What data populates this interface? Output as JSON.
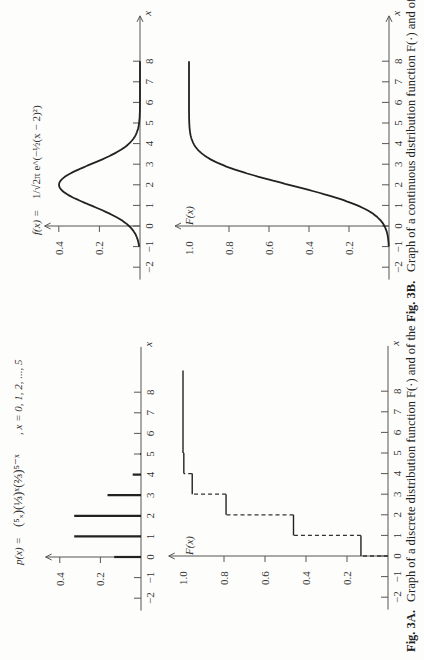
{
  "figures": {
    "fig3a": {
      "caption_label": "Fig. 3A.",
      "caption_text": "Graph of a discrete distribution function F(·) and of the",
      "pmf_formula": "p(x) = (5 choose x)(1/3)^x(2/3)^(5−x)",
      "pmf_formula_lhs": "p(x) =",
      "pmf_formula_rhs": "(⁵ₓ)(⅓)ˣ(⅔)⁵⁻ˣ",
      "pmf_domain": ", x = 0, 1, 2, ..., 5",
      "cdf_axis_label": "F(x)"
    },
    "fig3b": {
      "caption_label": "Fig. 3B.",
      "caption_text": "Graph of a continuous distribution function F(·) and of",
      "pdf_formula_lhs": "f(x) =",
      "pdf_formula_rhs": "1/√2π  e^(−½(x − 2)²)",
      "cdf_axis_label": "F(x)"
    }
  },
  "chart_data": [
    {
      "id": "fig3b-density",
      "type": "line",
      "title": "f(x) = 1/√(2π) e^(−½(x−2)²)",
      "xlabel": "x",
      "ylabel": "f(x)",
      "x_ticks": [
        -2,
        -1,
        0,
        1,
        2,
        3,
        4,
        5,
        6,
        7,
        8
      ],
      "y_ticks": [
        0.2,
        0.4
      ],
      "xlim": [
        -2.5,
        9
      ],
      "ylim": [
        0,
        0.45
      ],
      "curve": "normal_pdf",
      "mean": 2,
      "sd": 1,
      "x_range": [
        -1,
        8
      ],
      "orientation": "rotated -90deg (x-axis vertical, page landscape)"
    },
    {
      "id": "fig3b-cdf",
      "type": "line",
      "title": "Continuous distribution function",
      "xlabel": "x",
      "ylabel": "F(x)",
      "x_ticks": [
        -2,
        -1,
        0,
        1,
        2,
        3,
        4,
        5,
        6,
        7,
        8
      ],
      "y_ticks": [
        0.2,
        0.4,
        0.6,
        0.8,
        1.0
      ],
      "xlim": [
        -2.5,
        9
      ],
      "ylim": [
        0,
        1.05
      ],
      "curve": "normal_cdf",
      "mean": 2,
      "sd": 1,
      "x_range": [
        -1,
        8
      ]
    },
    {
      "id": "fig3a-pmf",
      "type": "bar",
      "title": "p(x) = C(5,x)(1/3)^x(2/3)^(5−x), x = 0,1,2,...,5",
      "xlabel": "x",
      "ylabel": "p(x)",
      "categories": [
        0,
        1,
        2,
        3,
        4,
        5
      ],
      "values": [
        0.132,
        0.329,
        0.329,
        0.165,
        0.041,
        0.004
      ],
      "x_ticks": [
        -2,
        -1,
        0,
        1,
        2,
        3,
        4,
        5,
        6,
        7,
        8
      ],
      "y_ticks": [
        0.2,
        0.4
      ],
      "ylim": [
        0,
        0.45
      ]
    },
    {
      "id": "fig3a-cdf",
      "type": "line",
      "title": "Discrete distribution function (step)",
      "xlabel": "x",
      "ylabel": "F(x)",
      "step_x": [
        0,
        1,
        2,
        3,
        4,
        5
      ],
      "step_values": [
        0.132,
        0.461,
        0.79,
        0.955,
        0.996,
        1.0
      ],
      "x_ticks": [
        -2,
        -1,
        0,
        1,
        2,
        3,
        4,
        5,
        6,
        7,
        8
      ],
      "y_ticks": [
        0.2,
        0.4,
        0.6,
        0.8,
        1.0
      ],
      "ylim": [
        0,
        1.05
      ],
      "x_end": 9
    }
  ],
  "layout": {
    "ink": "#222222",
    "axis": "#555555",
    "paper": "#fdfdfb"
  }
}
